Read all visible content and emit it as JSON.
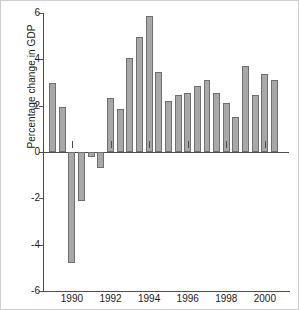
{
  "chart_data": {
    "type": "bar",
    "title": "",
    "xlabel": "",
    "ylabel": "Percentage change in GDP",
    "ylim": [
      -6,
      6
    ],
    "yticks": [
      -6,
      -4,
      -2,
      0,
      2,
      4,
      6
    ],
    "ytick_labels": [
      "-6",
      "-4",
      "-2",
      "0",
      "2",
      "4",
      "6"
    ],
    "xlim": [
      1988.75,
      2001.5
    ],
    "xticks": [
      1990,
      1992,
      1994,
      1996,
      1998,
      2000
    ],
    "xtick_labels": [
      "1990",
      "1992",
      "1994",
      "1996",
      "1998",
      "2000"
    ],
    "grid": false,
    "legend": null,
    "bar_color": "#a8a8a8",
    "bar_edge_color": "#6f6f6f",
    "axis_color": "#4d4d4d",
    "x": [
      1989.0,
      1989.5,
      1990.0,
      1990.5,
      1991.0,
      1991.5,
      1992.0,
      1992.5,
      1993.0,
      1993.5,
      1994.0,
      1994.5,
      1995.0,
      1995.5,
      1996.0,
      1996.5,
      1997.0,
      1997.5,
      1998.0,
      1998.5,
      1999.0,
      1999.5,
      2000.0,
      2000.5
    ],
    "categories": [
      "1989 H1",
      "1989 H2",
      "1990 H1",
      "1990 H2",
      "1991 H1",
      "1991 H2",
      "1992 H1",
      "1992 H2",
      "1993 H1",
      "1993 H2",
      "1994 H1",
      "1994 H2",
      "1995 H1",
      "1995 H2",
      "1996 H1",
      "1996 H2",
      "1997 H1",
      "1997 H2",
      "1998 H1",
      "1998 H2",
      "1999 H1",
      "1999 H2",
      "2000 H1",
      "2000 H2"
    ],
    "values": [
      3.0,
      1.95,
      -4.8,
      -2.1,
      -0.2,
      -0.7,
      2.35,
      1.85,
      4.05,
      4.95,
      5.85,
      3.45,
      2.2,
      2.45,
      2.55,
      2.85,
      3.1,
      2.55,
      2.1,
      1.5,
      3.7,
      2.45,
      3.35,
      3.1
    ]
  }
}
